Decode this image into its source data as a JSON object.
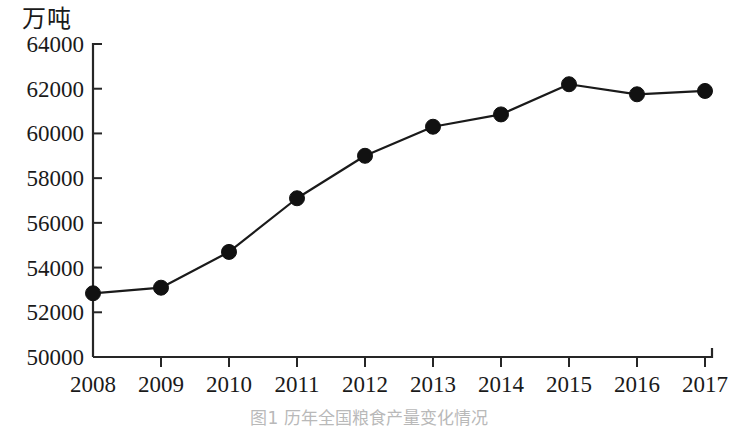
{
  "chart_data": {
    "type": "line",
    "title": "",
    "subtitle": "",
    "unit_label": "万吨",
    "xlabel": "",
    "ylabel": "",
    "categories": [
      "2008",
      "2009",
      "2010",
      "2011",
      "2012",
      "2013",
      "2014",
      "2015",
      "2016",
      "2017"
    ],
    "values": [
      52850,
      53100,
      54700,
      57100,
      59000,
      60300,
      60850,
      62200,
      61750,
      61900
    ],
    "series": [
      {
        "name": "粮食产量",
        "values": [
          52850,
          53100,
          54700,
          57100,
          59000,
          60300,
          60850,
          62200,
          61750,
          61900
        ]
      }
    ],
    "ylim": [
      50000,
      64000
    ],
    "ytick_step": 2000,
    "ytick_labels": [
      "50000",
      "52000",
      "54000",
      "56000",
      "58000",
      "60000",
      "62000",
      "64000"
    ],
    "xtick_labels": [
      "2008",
      "2009",
      "2010",
      "2011",
      "2012",
      "2013",
      "2014",
      "2015",
      "2016",
      "2017"
    ],
    "grid": false,
    "legend": false,
    "legend_position": "none",
    "marker": "filled-circle",
    "line_color": "#1a1a1a",
    "marker_color": "#111111",
    "axis_color": "#262626"
  },
  "caption": {
    "text": "图1  历年全国粮食产量变化情况"
  }
}
